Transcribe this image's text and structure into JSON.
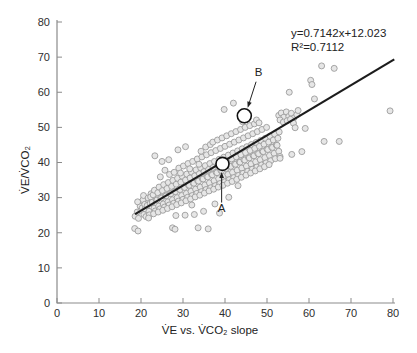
{
  "figure": {
    "background": "#ffffff",
    "equation_line1": "y=0.7142x+12.023",
    "equation_line2": "R²=0.7112"
  },
  "chart_data": {
    "type": "scatter",
    "title": "",
    "xlabel": "V̇E vs. V̇CO₂ slope",
    "ylabel": "V̇E/V̇CO₂",
    "xlim": [
      0,
      80
    ],
    "ylim": [
      0,
      80
    ],
    "x_ticks": [
      0,
      10,
      20,
      30,
      40,
      50,
      60,
      70,
      80
    ],
    "y_ticks": [
      0,
      10,
      20,
      30,
      40,
      50,
      60,
      70,
      80
    ],
    "grid": false,
    "legend": "none",
    "axis_color": "#8b8b8b",
    "tick_label_color": "#2e2e2e",
    "point_style": {
      "radius": 3.0,
      "fill": "#e6e6e6",
      "stroke": "#9c9c9c",
      "stroke_width": 0.9
    },
    "trendline": {
      "slope": 0.7142,
      "intercept": 12.023,
      "x_start": 18.6,
      "x_end": 80.3,
      "color": "#1c1c1c",
      "width": 2.2
    },
    "equation": {
      "line1": "y=0.7142x+12.023",
      "line2": "R²=0.7112"
    },
    "r_squared": 0.7112,
    "highlighted_points": [
      {
        "label": "A",
        "x": 39.4,
        "y": 39.6,
        "radius": 6.5,
        "label_pos": [
          39.2,
          25.9
        ],
        "arrow_from": [
          39.2,
          28.6
        ],
        "arrow_to": [
          39.2,
          37.3
        ]
      },
      {
        "label": "B",
        "x": 44.6,
        "y": 53.3,
        "radius": 7.0,
        "label_pos": [
          48.0,
          64.6
        ],
        "arrow_from": [
          47.4,
          63.0
        ],
        "arrow_to": [
          45.4,
          55.6
        ]
      }
    ],
    "annotation_color": "#222222",
    "points": [
      [
        18.6,
        24.7
      ],
      [
        19.1,
        25.9
      ],
      [
        19.4,
        24.1
      ],
      [
        19.8,
        27.6
      ],
      [
        19.2,
        28.8
      ],
      [
        20.0,
        26.4
      ],
      [
        18.5,
        21.2
      ],
      [
        19.3,
        20.5
      ],
      [
        20.3,
        27.1
      ],
      [
        20.7,
        25.2
      ],
      [
        20.5,
        29.4
      ],
      [
        21.0,
        26.8
      ],
      [
        20.9,
        28.1
      ],
      [
        21.2,
        24.6
      ],
      [
        20.6,
        30.6
      ],
      [
        21.5,
        27.8
      ],
      [
        21.9,
        26.1
      ],
      [
        21.7,
        29.9
      ],
      [
        22.2,
        28.4
      ],
      [
        22.0,
        25.1
      ],
      [
        22.4,
        31.1
      ],
      [
        21.8,
        24.2
      ],
      [
        22.3,
        30.2
      ],
      [
        22.7,
        28.7
      ],
      [
        23.1,
        27.0
      ],
      [
        22.9,
        30.8
      ],
      [
        23.4,
        26.2
      ],
      [
        23.2,
        32.1
      ],
      [
        23.6,
        29.4
      ],
      [
        23.0,
        25.4
      ],
      [
        23.3,
        41.9
      ],
      [
        23.8,
        29.3
      ],
      [
        24.2,
        27.6
      ],
      [
        24.0,
        31.4
      ],
      [
        24.5,
        26.8
      ],
      [
        24.3,
        33.0
      ],
      [
        24.7,
        30.0
      ],
      [
        24.1,
        25.9
      ],
      [
        24.6,
        35.9
      ],
      [
        24.9,
        29.9
      ],
      [
        25.3,
        28.2
      ],
      [
        25.1,
        32.0
      ],
      [
        25.6,
        27.3
      ],
      [
        25.4,
        33.7
      ],
      [
        25.8,
        30.6
      ],
      [
        25.2,
        26.4
      ],
      [
        25.7,
        37.8
      ],
      [
        25.0,
        40.3
      ],
      [
        26.0,
        30.5
      ],
      [
        26.4,
        28.8
      ],
      [
        26.2,
        32.6
      ],
      [
        26.7,
        27.9
      ],
      [
        26.5,
        34.3
      ],
      [
        26.9,
        31.2
      ],
      [
        26.3,
        26.9
      ],
      [
        26.8,
        36.6
      ],
      [
        27.1,
        31.1
      ],
      [
        27.5,
        29.4
      ],
      [
        27.3,
        33.2
      ],
      [
        27.8,
        28.4
      ],
      [
        27.6,
        34.9
      ],
      [
        28.0,
        31.8
      ],
      [
        27.4,
        27.4
      ],
      [
        27.9,
        37.2
      ],
      [
        27.5,
        21.4
      ],
      [
        28.1,
        21.0
      ],
      [
        28.2,
        31.7
      ],
      [
        28.6,
        30.0
      ],
      [
        28.4,
        33.8
      ],
      [
        28.9,
        29.0
      ],
      [
        28.7,
        35.5
      ],
      [
        29.1,
        32.4
      ],
      [
        28.5,
        28.0
      ],
      [
        29.0,
        38.4
      ],
      [
        28.3,
        24.9
      ],
      [
        29.3,
        32.3
      ],
      [
        29.7,
        30.6
      ],
      [
        29.5,
        34.4
      ],
      [
        30.0,
        29.5
      ],
      [
        29.8,
        36.1
      ],
      [
        30.2,
        33.0
      ],
      [
        29.6,
        28.5
      ],
      [
        30.1,
        39.0
      ],
      [
        29.4,
        37.0
      ],
      [
        30.4,
        32.9
      ],
      [
        30.8,
        31.2
      ],
      [
        30.6,
        35.0
      ],
      [
        31.1,
        30.1
      ],
      [
        30.9,
        36.7
      ],
      [
        31.3,
        33.6
      ],
      [
        30.7,
        29.1
      ],
      [
        31.2,
        39.7
      ],
      [
        30.5,
        25.0
      ],
      [
        31.5,
        33.5
      ],
      [
        31.9,
        31.8
      ],
      [
        31.7,
        35.6
      ],
      [
        32.2,
        30.6
      ],
      [
        32.0,
        37.3
      ],
      [
        32.4,
        34.2
      ],
      [
        31.8,
        29.6
      ],
      [
        32.3,
        40.3
      ],
      [
        31.6,
        38.2
      ],
      [
        32.1,
        27.9
      ],
      [
        32.6,
        34.1
      ],
      [
        33.0,
        32.4
      ],
      [
        32.8,
        36.2
      ],
      [
        33.3,
        31.2
      ],
      [
        33.1,
        37.9
      ],
      [
        33.5,
        34.8
      ],
      [
        32.9,
        30.2
      ],
      [
        33.4,
        41.0
      ],
      [
        32.7,
        25.2
      ],
      [
        33.6,
        21.4
      ],
      [
        33.7,
        34.7
      ],
      [
        34.1,
        33.0
      ],
      [
        33.9,
        36.8
      ],
      [
        34.4,
        31.7
      ],
      [
        34.2,
        38.5
      ],
      [
        34.6,
        35.4
      ],
      [
        34.0,
        30.7
      ],
      [
        34.5,
        41.6
      ],
      [
        33.8,
        39.5
      ],
      [
        34.3,
        43.2
      ],
      [
        34.8,
        35.3
      ],
      [
        35.2,
        33.6
      ],
      [
        35.0,
        37.4
      ],
      [
        35.5,
        32.3
      ],
      [
        35.3,
        39.1
      ],
      [
        35.7,
        36.0
      ],
      [
        35.1,
        31.3
      ],
      [
        35.6,
        42.2
      ],
      [
        34.9,
        26.1
      ],
      [
        35.4,
        44.4
      ],
      [
        35.9,
        35.9
      ],
      [
        36.3,
        34.2
      ],
      [
        36.1,
        38.0
      ],
      [
        36.6,
        32.8
      ],
      [
        36.4,
        39.7
      ],
      [
        36.8,
        36.6
      ],
      [
        36.2,
        31.9
      ],
      [
        36.7,
        42.8
      ],
      [
        36.0,
        21.1
      ],
      [
        36.5,
        45.1
      ],
      [
        37.0,
        36.5
      ],
      [
        37.4,
        34.8
      ],
      [
        37.2,
        38.6
      ],
      [
        37.7,
        33.4
      ],
      [
        37.5,
        40.3
      ],
      [
        37.9,
        37.2
      ],
      [
        37.3,
        32.4
      ],
      [
        37.8,
        43.4
      ],
      [
        37.1,
        45.8
      ],
      [
        37.6,
        28.2
      ],
      [
        38.1,
        37.1
      ],
      [
        38.5,
        35.4
      ],
      [
        38.3,
        39.2
      ],
      [
        38.8,
        34.0
      ],
      [
        38.6,
        40.9
      ],
      [
        39.0,
        37.8
      ],
      [
        38.4,
        33.0
      ],
      [
        38.9,
        44.0
      ],
      [
        38.2,
        46.4
      ],
      [
        38.7,
        25.6
      ],
      [
        39.2,
        37.7
      ],
      [
        39.6,
        36.0
      ],
      [
        39.4,
        40.6
      ],
      [
        39.9,
        34.5
      ],
      [
        39.7,
        41.5
      ],
      [
        40.1,
        38.4
      ],
      [
        39.5,
        33.5
      ],
      [
        40.0,
        44.6
      ],
      [
        39.3,
        47.0
      ],
      [
        39.8,
        55.1
      ],
      [
        40.3,
        38.3
      ],
      [
        40.7,
        36.6
      ],
      [
        40.5,
        40.4
      ],
      [
        41.0,
        35.1
      ],
      [
        40.8,
        42.1
      ],
      [
        41.2,
        39.0
      ],
      [
        40.6,
        34.1
      ],
      [
        41.1,
        45.2
      ],
      [
        40.4,
        47.6
      ],
      [
        40.9,
        30.1
      ],
      [
        41.4,
        38.9
      ],
      [
        41.8,
        37.2
      ],
      [
        41.6,
        41.0
      ],
      [
        42.1,
        35.7
      ],
      [
        41.9,
        42.7
      ],
      [
        42.3,
        39.6
      ],
      [
        41.7,
        34.6
      ],
      [
        42.2,
        45.8
      ],
      [
        41.5,
        48.2
      ],
      [
        42.0,
        56.9
      ],
      [
        42.5,
        39.5
      ],
      [
        42.9,
        37.8
      ],
      [
        42.7,
        41.6
      ],
      [
        43.2,
        36.3
      ],
      [
        43.0,
        43.3
      ],
      [
        43.4,
        40.2
      ],
      [
        42.8,
        35.2
      ],
      [
        43.3,
        46.4
      ],
      [
        42.6,
        48.8
      ],
      [
        43.1,
        33.4
      ],
      [
        43.6,
        40.1
      ],
      [
        44.0,
        38.4
      ],
      [
        43.8,
        42.2
      ],
      [
        44.3,
        36.9
      ],
      [
        44.1,
        43.9
      ],
      [
        44.5,
        40.8
      ],
      [
        43.9,
        35.8
      ],
      [
        44.4,
        47.0
      ],
      [
        43.7,
        49.4
      ],
      [
        44.2,
        51.6
      ],
      [
        44.7,
        40.7
      ],
      [
        45.1,
        39.0
      ],
      [
        44.9,
        42.8
      ],
      [
        45.4,
        37.5
      ],
      [
        45.2,
        44.5
      ],
      [
        45.6,
        41.4
      ],
      [
        45.0,
        36.4
      ],
      [
        45.5,
        47.6
      ],
      [
        44.8,
        50.0
      ],
      [
        45.3,
        52.4
      ],
      [
        45.8,
        41.3
      ],
      [
        46.2,
        39.6
      ],
      [
        46.0,
        43.4
      ],
      [
        46.5,
        38.1
      ],
      [
        46.3,
        45.1
      ],
      [
        46.7,
        42.0
      ],
      [
        46.1,
        37.0
      ],
      [
        46.6,
        48.2
      ],
      [
        45.9,
        50.5
      ],
      [
        46.9,
        41.9
      ],
      [
        47.3,
        40.2
      ],
      [
        47.1,
        44.0
      ],
      [
        47.6,
        38.7
      ],
      [
        47.4,
        45.7
      ],
      [
        47.8,
        42.6
      ],
      [
        47.2,
        37.6
      ],
      [
        47.7,
        48.8
      ],
      [
        47.0,
        51.0
      ],
      [
        47.5,
        52.1
      ],
      [
        48.0,
        42.5
      ],
      [
        48.4,
        40.8
      ],
      [
        48.2,
        44.6
      ],
      [
        48.7,
        39.3
      ],
      [
        48.5,
        46.3
      ],
      [
        48.9,
        43.2
      ],
      [
        48.3,
        38.2
      ],
      [
        48.8,
        49.4
      ],
      [
        48.1,
        51.3
      ],
      [
        49.1,
        43.1
      ],
      [
        49.5,
        41.4
      ],
      [
        49.3,
        45.2
      ],
      [
        49.8,
        39.9
      ],
      [
        49.6,
        46.9
      ],
      [
        50.0,
        43.8
      ],
      [
        49.4,
        38.8
      ],
      [
        49.9,
        50.0
      ],
      [
        50.2,
        43.7
      ],
      [
        50.6,
        42.0
      ],
      [
        50.4,
        45.8
      ],
      [
        50.9,
        40.5
      ],
      [
        50.7,
        47.5
      ],
      [
        51.1,
        44.4
      ],
      [
        50.5,
        39.4
      ],
      [
        51.3,
        44.3
      ],
      [
        51.7,
        42.6
      ],
      [
        51.5,
        46.4
      ],
      [
        52.0,
        41.1
      ],
      [
        51.8,
        48.1
      ],
      [
        52.2,
        45.0
      ],
      [
        52.4,
        44.9
      ],
      [
        52.8,
        43.2
      ],
      [
        52.6,
        46.9
      ],
      [
        53.1,
        41.7
      ],
      [
        52.9,
        48.7
      ],
      [
        52.8,
        53.4
      ],
      [
        53.4,
        54.1
      ],
      [
        54.0,
        52.9
      ],
      [
        54.6,
        54.4
      ],
      [
        55.2,
        53.1
      ],
      [
        55.8,
        54.0
      ],
      [
        56.4,
        52.7
      ],
      [
        53.1,
        52.1
      ],
      [
        53.9,
        51.5
      ],
      [
        54.8,
        51.9
      ],
      [
        55.6,
        52.3
      ],
      [
        56.3,
        51.2
      ],
      [
        57.1,
        53.6
      ],
      [
        57.4,
        54.8
      ],
      [
        53.1,
        41.2
      ],
      [
        55.9,
        42.3
      ],
      [
        56.7,
        49.9
      ],
      [
        59.1,
        49.7
      ],
      [
        55.3,
        60.0
      ],
      [
        60.4,
        63.4
      ],
      [
        60.7,
        62.2
      ],
      [
        61.3,
        58.1
      ],
      [
        63.0,
        67.5
      ],
      [
        66.0,
        66.8
      ],
      [
        63.6,
        46.0
      ],
      [
        67.2,
        46.0
      ],
      [
        79.3,
        54.7
      ],
      [
        58.3,
        43.1
      ],
      [
        28.8,
        43.6
      ],
      [
        30.6,
        44.5
      ],
      [
        26.6,
        40.8
      ]
    ]
  }
}
